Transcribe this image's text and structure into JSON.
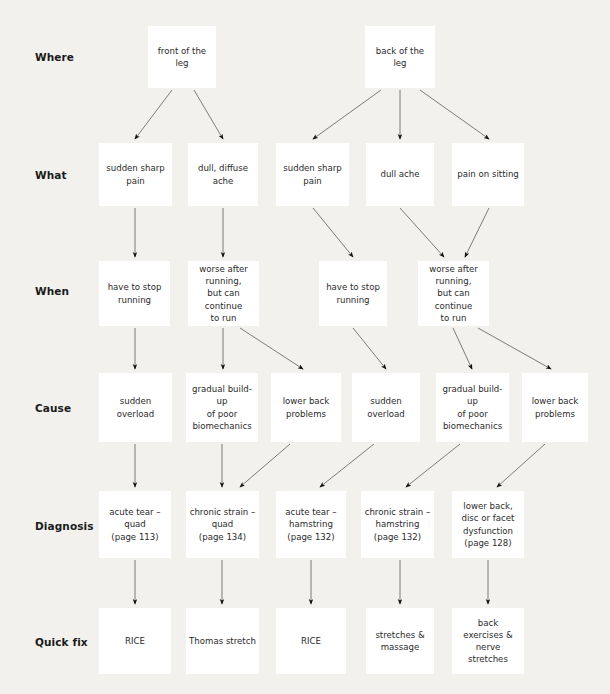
{
  "diagram": {
    "background_color": "#f2f1ee",
    "node_color": "#ffffff",
    "edge_color": "#6e6e6e",
    "text_color": "#2b2b2b",
    "label_color": "#1a1a1a",
    "rows": [
      {
        "id": "where",
        "label": "Where"
      },
      {
        "id": "what",
        "label": "What"
      },
      {
        "id": "when",
        "label": "When"
      },
      {
        "id": "cause",
        "label": "Cause"
      },
      {
        "id": "diagnosis",
        "label": "Diagnosis"
      },
      {
        "id": "quickfix",
        "label": "Quick fix"
      }
    ],
    "nodes": [
      {
        "id": "w1",
        "row": "where",
        "text": "front of the\nleg",
        "x": 148,
        "y": 26,
        "w": 68,
        "h": 62
      },
      {
        "id": "w2",
        "row": "where",
        "text": "back of the\nleg",
        "x": 365,
        "y": 26,
        "w": 70,
        "h": 62
      },
      {
        "id": "t1",
        "row": "what",
        "text": "sudden sharp\npain",
        "x": 99,
        "y": 143,
        "w": 73,
        "h": 63
      },
      {
        "id": "t2",
        "row": "what",
        "text": "dull, diffuse\nache",
        "x": 188,
        "y": 143,
        "w": 70,
        "h": 63
      },
      {
        "id": "t3",
        "row": "what",
        "text": "sudden sharp\npain",
        "x": 276,
        "y": 143,
        "w": 73,
        "h": 63
      },
      {
        "id": "t4",
        "row": "what",
        "text": "dull ache",
        "x": 366,
        "y": 143,
        "w": 68,
        "h": 63
      },
      {
        "id": "t5",
        "row": "what",
        "text": "pain on sitting",
        "x": 452,
        "y": 143,
        "w": 72,
        "h": 63
      },
      {
        "id": "n1",
        "row": "when",
        "text": "have to stop\nrunning",
        "x": 99,
        "y": 261,
        "w": 71,
        "h": 65
      },
      {
        "id": "n2",
        "row": "when",
        "text": "worse after\nrunning,\nbut can continue\nto run",
        "x": 188,
        "y": 261,
        "w": 71,
        "h": 65
      },
      {
        "id": "n3",
        "row": "when",
        "text": "have to stop\nrunning",
        "x": 319,
        "y": 261,
        "w": 68,
        "h": 65
      },
      {
        "id": "n4",
        "row": "when",
        "text": "worse after\nrunning,\nbut can continue\nto run",
        "x": 418,
        "y": 261,
        "w": 71,
        "h": 65
      },
      {
        "id": "c1",
        "row": "cause",
        "text": "sudden overload",
        "x": 99,
        "y": 373,
        "w": 73,
        "h": 69
      },
      {
        "id": "c2",
        "row": "cause",
        "text": "gradual build-up\nof poor\nbiomechanics",
        "x": 186,
        "y": 373,
        "w": 72,
        "h": 69
      },
      {
        "id": "c3",
        "row": "cause",
        "text": "lower back\nproblems",
        "x": 271,
        "y": 373,
        "w": 70,
        "h": 69
      },
      {
        "id": "c4",
        "row": "cause",
        "text": "sudden overload",
        "x": 352,
        "y": 373,
        "w": 68,
        "h": 69
      },
      {
        "id": "c5",
        "row": "cause",
        "text": "gradual build-up\nof poor\nbiomechanics",
        "x": 436,
        "y": 373,
        "w": 73,
        "h": 69
      },
      {
        "id": "c6",
        "row": "cause",
        "text": "lower back\nproblems",
        "x": 522,
        "y": 373,
        "w": 66,
        "h": 69
      },
      {
        "id": "d1",
        "row": "diagnosis",
        "text": "acute tear –\nquad\n(page 113)",
        "x": 99,
        "y": 491,
        "w": 72,
        "h": 67
      },
      {
        "id": "d2",
        "row": "diagnosis",
        "text": "chronic strain –\nquad\n(page 134)",
        "x": 186,
        "y": 491,
        "w": 73,
        "h": 67
      },
      {
        "id": "d3",
        "row": "diagnosis",
        "text": "acute tear –\nhamstring\n(page 132)",
        "x": 276,
        "y": 491,
        "w": 70,
        "h": 67
      },
      {
        "id": "d4",
        "row": "diagnosis",
        "text": "chronic strain –\nhamstring\n(page 132)",
        "x": 361,
        "y": 491,
        "w": 73,
        "h": 67
      },
      {
        "id": "d5",
        "row": "diagnosis",
        "text": "lower back,\ndisc or facet\ndysfunction\n(page 128)",
        "x": 452,
        "y": 491,
        "w": 72,
        "h": 67
      },
      {
        "id": "q1",
        "row": "quickfix",
        "text": "RICE",
        "x": 99,
        "y": 608,
        "w": 72,
        "h": 66
      },
      {
        "id": "q2",
        "row": "quickfix",
        "text": "Thomas stretch",
        "x": 186,
        "y": 608,
        "w": 73,
        "h": 66
      },
      {
        "id": "q3",
        "row": "quickfix",
        "text": "RICE",
        "x": 276,
        "y": 608,
        "w": 70,
        "h": 66
      },
      {
        "id": "q4",
        "row": "quickfix",
        "text": "stretches &\nmassage",
        "x": 366,
        "y": 608,
        "w": 68,
        "h": 66
      },
      {
        "id": "q5",
        "row": "quickfix",
        "text": "back\nexercises &\nnerve stretches",
        "x": 452,
        "y": 608,
        "w": 72,
        "h": 66
      }
    ],
    "row_label_positions": [
      {
        "row": "where",
        "x": 35,
        "y": 51
      },
      {
        "row": "what",
        "x": 35,
        "y": 169
      },
      {
        "row": "when",
        "x": 35,
        "y": 285
      },
      {
        "row": "cause",
        "x": 35,
        "y": 402
      },
      {
        "row": "diagnosis",
        "x": 35,
        "y": 520
      },
      {
        "row": "quickfix",
        "x": 35,
        "y": 636
      }
    ],
    "edges": [
      {
        "from": "w1",
        "to": "t1",
        "x1": 172,
        "y1": 90,
        "x2": 135,
        "y2": 139
      },
      {
        "from": "w1",
        "to": "t2",
        "x1": 194,
        "y1": 90,
        "x2": 223,
        "y2": 139
      },
      {
        "from": "w2",
        "to": "t3",
        "x1": 381,
        "y1": 90,
        "x2": 313,
        "y2": 139
      },
      {
        "from": "w2",
        "to": "t4",
        "x1": 400,
        "y1": 90,
        "x2": 400,
        "y2": 139
      },
      {
        "from": "w2",
        "to": "t5",
        "x1": 420,
        "y1": 90,
        "x2": 489,
        "y2": 139
      },
      {
        "from": "t1",
        "to": "n1",
        "x1": 135,
        "y1": 208,
        "x2": 135,
        "y2": 257
      },
      {
        "from": "t2",
        "to": "n2",
        "x1": 223,
        "y1": 208,
        "x2": 223,
        "y2": 257
      },
      {
        "from": "t3",
        "to": "n3",
        "x1": 313,
        "y1": 208,
        "x2": 353,
        "y2": 257
      },
      {
        "from": "t4",
        "to": "n4",
        "x1": 400,
        "y1": 208,
        "x2": 444,
        "y2": 257
      },
      {
        "from": "t5",
        "to": "n4",
        "x1": 489,
        "y1": 208,
        "x2": 465,
        "y2": 257
      },
      {
        "from": "n1",
        "to": "c1",
        "x1": 135,
        "y1": 328,
        "x2": 135,
        "y2": 369
      },
      {
        "from": "n2",
        "to": "c2",
        "x1": 223,
        "y1": 328,
        "x2": 223,
        "y2": 369
      },
      {
        "from": "n2",
        "to": "c3",
        "x1": 240,
        "y1": 328,
        "x2": 303,
        "y2": 369
      },
      {
        "from": "n3",
        "to": "c4",
        "x1": 353,
        "y1": 328,
        "x2": 386,
        "y2": 369
      },
      {
        "from": "n4",
        "to": "c5",
        "x1": 453,
        "y1": 328,
        "x2": 472,
        "y2": 369
      },
      {
        "from": "n4",
        "to": "c6",
        "x1": 478,
        "y1": 328,
        "x2": 551,
        "y2": 369
      },
      {
        "from": "c1",
        "to": "d1",
        "x1": 135,
        "y1": 444,
        "x2": 135,
        "y2": 487
      },
      {
        "from": "c2",
        "to": "d2",
        "x1": 222,
        "y1": 444,
        "x2": 222,
        "y2": 487
      },
      {
        "from": "c3",
        "to": "d2",
        "x1": 290,
        "y1": 444,
        "x2": 240,
        "y2": 487
      },
      {
        "from": "c4",
        "to": "d3",
        "x1": 374,
        "y1": 444,
        "x2": 320,
        "y2": 487
      },
      {
        "from": "c5",
        "to": "d4",
        "x1": 460,
        "y1": 444,
        "x2": 406,
        "y2": 487
      },
      {
        "from": "c6",
        "to": "d5",
        "x1": 545,
        "y1": 444,
        "x2": 497,
        "y2": 487
      },
      {
        "from": "d1",
        "to": "q1",
        "x1": 135,
        "y1": 560,
        "x2": 135,
        "y2": 604
      },
      {
        "from": "d2",
        "to": "q2",
        "x1": 222,
        "y1": 560,
        "x2": 222,
        "y2": 604
      },
      {
        "from": "d3",
        "to": "q3",
        "x1": 311,
        "y1": 560,
        "x2": 311,
        "y2": 604
      },
      {
        "from": "d4",
        "to": "q4",
        "x1": 400,
        "y1": 560,
        "x2": 400,
        "y2": 604
      },
      {
        "from": "d5",
        "to": "q5",
        "x1": 488,
        "y1": 560,
        "x2": 488,
        "y2": 604
      }
    ]
  }
}
